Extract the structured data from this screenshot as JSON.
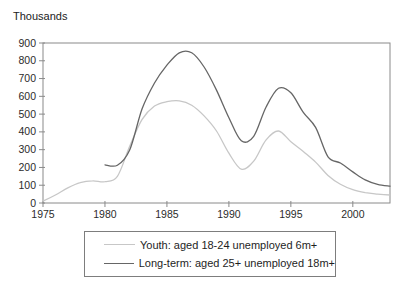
{
  "chart_data": {
    "type": "line",
    "title": "",
    "ylabel": "Thousands",
    "xlabel": "",
    "grid": false,
    "legend_position": "bottom",
    "xlim": [
      1975,
      2003
    ],
    "ylim": [
      0,
      900
    ],
    "xticks": [
      1975,
      1980,
      1985,
      1990,
      1995,
      2000
    ],
    "yticks": [
      0,
      100,
      200,
      300,
      400,
      500,
      600,
      700,
      800,
      900
    ],
    "x": [
      1975,
      1976,
      1977,
      1978,
      1979,
      1980,
      1981,
      1982,
      1983,
      1984,
      1985,
      1986,
      1987,
      1988,
      1989,
      1990,
      1991,
      1992,
      1993,
      1994,
      1995,
      1996,
      1997,
      1998,
      1999,
      2000,
      2001,
      2002,
      2003
    ],
    "series": [
      {
        "name": "Youth: aged 18-24 unemployed 6m+",
        "color": "#c7c7c7",
        "values": [
          10,
          45,
          85,
          115,
          125,
          120,
          150,
          320,
          470,
          545,
          570,
          575,
          550,
          490,
          405,
          280,
          190,
          235,
          355,
          405,
          345,
          290,
          230,
          155,
          105,
          75,
          58,
          50,
          45
        ]
      },
      {
        "name": "Long-term: aged 25+ unemployed 18m+",
        "color": "#666666",
        "values": [
          null,
          null,
          null,
          null,
          null,
          215,
          212,
          300,
          530,
          675,
          775,
          845,
          845,
          765,
          635,
          480,
          350,
          375,
          540,
          645,
          620,
          510,
          425,
          260,
          225,
          175,
          130,
          105,
          95
        ]
      }
    ]
  },
  "style": {
    "frame_color": "#8a8a8a",
    "tick_text_color": "#2b2b2b",
    "background": "#ffffff",
    "legend_border_color": "#7d7d7d"
  }
}
